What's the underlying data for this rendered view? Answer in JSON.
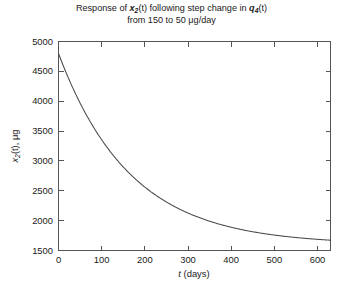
{
  "chart_data": {
    "type": "line",
    "title_line1": "Response of x₂(t)  following step change in q₄(t)",
    "title_line2": "from 150 to 50 μg/day",
    "title_parts": {
      "l1_a": "Response of ",
      "l1_var": "x",
      "l1_sub": "2",
      "l1_b": "(t)  following step change in ",
      "l1_var2": "q",
      "l1_sub2": "4",
      "l1_c": "(t)",
      "l2_a": "from 150 to 50 ",
      "l2_mu": "μ",
      "l2_b": "g/day"
    },
    "xlabel": "t (days)",
    "xlabel_parts": {
      "var": "t",
      "rest": " (days)"
    },
    "ylabel": "x₂(t), μg",
    "ylabel_parts": {
      "var": "x",
      "sub": "2",
      "mid": "(t), ",
      "mu": "μ",
      "unit": "g"
    },
    "xlim": [
      0,
      630
    ],
    "ylim": [
      1500,
      5000
    ],
    "xticks": [
      0,
      100,
      200,
      300,
      400,
      500,
      600
    ],
    "xticklabels": [
      "0",
      "100",
      "200",
      "300",
      "400",
      "500",
      "600"
    ],
    "yticks": [
      1500,
      2000,
      2500,
      3000,
      3500,
      4000,
      4500,
      5000
    ],
    "yticklabels": [
      "1500",
      "2000",
      "2500",
      "3000",
      "3500",
      "4000",
      "4500",
      "5000"
    ],
    "grid": false,
    "legend": null,
    "line_color": "#4a4a4a",
    "series": [
      {
        "name": "x2(t)",
        "x": [
          0,
          10,
          20,
          30,
          40,
          50,
          60,
          70,
          80,
          90,
          100,
          120,
          140,
          160,
          180,
          200,
          220,
          240,
          260,
          280,
          300,
          330,
          360,
          390,
          420,
          450,
          480,
          510,
          540,
          570,
          600,
          630
        ],
        "y": [
          4800,
          4594,
          4402,
          4221,
          4053,
          3895,
          3748,
          3610,
          3481,
          3361,
          3248,
          3044,
          2867,
          2712,
          2577,
          2459,
          2356,
          2266,
          2187,
          2118,
          2058,
          1982,
          1921,
          1872,
          1832,
          1800,
          1774,
          1753,
          1736,
          1722,
          1710,
          1701
        ]
      }
    ],
    "model": {
      "initial_value": 4800,
      "asymptote": 1600,
      "note": "exponential decay"
    }
  },
  "figure": {
    "background": "#ffffff",
    "axis_color": "#555555"
  }
}
